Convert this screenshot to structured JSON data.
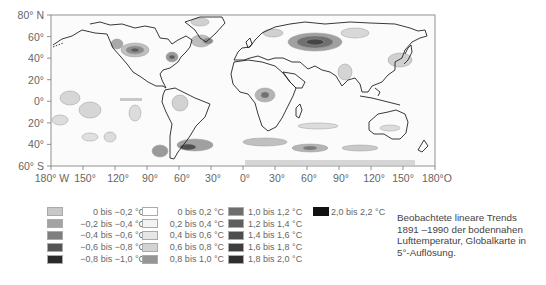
{
  "map": {
    "y_axis": {
      "ticks": [
        {
          "label": "80° N",
          "lat": 80
        },
        {
          "label": "60°",
          "lat": 60
        },
        {
          "label": "40°",
          "lat": 40
        },
        {
          "label": "20°",
          "lat": 20
        },
        {
          "label": "0°",
          "lat": 0
        },
        {
          "label": "20°",
          "lat": -20
        },
        {
          "label": "40°",
          "lat": -40
        },
        {
          "label": "60° S",
          "lat": -60
        }
      ]
    },
    "x_axis": {
      "ticks": [
        {
          "label": "180° W",
          "lon": -180
        },
        {
          "label": "150°",
          "lon": -150
        },
        {
          "label": "120°",
          "lon": -120
        },
        {
          "label": "90°",
          "lon": -90
        },
        {
          "label": "60°",
          "lon": -60
        },
        {
          "label": "30°",
          "lon": -30
        },
        {
          "label": "0°",
          "lon": 0
        },
        {
          "label": "30°",
          "lon": 30
        },
        {
          "label": "60°",
          "lon": 60
        },
        {
          "label": "90°",
          "lon": 90
        },
        {
          "label": "120°",
          "lon": 120
        },
        {
          "label": "150°",
          "lon": 150
        },
        {
          "label": "180°O",
          "lon": 180
        }
      ]
    }
  },
  "legend": {
    "col1": [
      {
        "label": "0 bis −0,2 °C",
        "color": "#c8c8c8"
      },
      {
        "label": "−0,2 bis −0,4 °C",
        "color": "#a3a3a3"
      },
      {
        "label": "−0,4 bis −0,6 °C",
        "color": "#7e7e7e"
      },
      {
        "label": "−0,6 bis −0,8 °C",
        "color": "#555555"
      },
      {
        "label": "−0,8 bis −1,0 °C",
        "color": "#2a2a2a"
      }
    ],
    "col2": [
      {
        "label": "0 bis 0,2 °C",
        "color": "#ffffff"
      },
      {
        "label": "0,2 bis 0,4 °C",
        "color": "#f3f3f3"
      },
      {
        "label": "0,4 bis 0,6 °C",
        "color": "#e6e6e6"
      },
      {
        "label": "0,6 bis 0,8 °C",
        "color": "#d2d2d2"
      },
      {
        "label": "0,8 bis 1,0 °C",
        "color": "#959595"
      }
    ],
    "col3": [
      {
        "label": "1,0 bis 1,2 °C",
        "color": "#6e6e6e"
      },
      {
        "label": "1,2 bis 1,4 °C",
        "color": "#5e5e5e"
      },
      {
        "label": "1,4 bis 1,6 °C",
        "color": "#4e4e4e"
      },
      {
        "label": "1,6 bis 1,8 °C",
        "color": "#3e3e3e"
      },
      {
        "label": "1,8 bis 2,0 °C",
        "color": "#2e2e2e"
      }
    ],
    "col4": [
      {
        "label": "2,0 bis 2,2 °C",
        "color": "#111111"
      }
    ]
  },
  "caption": {
    "line1": "Beobachtete lineare Trends",
    "line2": "1891 –1990 der bodennahen",
    "line3": "Lufttemperatur, Globalkarte in",
    "line4": "5°-Auflösung."
  }
}
